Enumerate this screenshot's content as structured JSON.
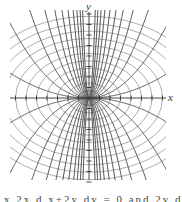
{
  "figure": {
    "type": "orthogonal-trajectories",
    "axes": {
      "x_label": "x",
      "y_label": "y"
    },
    "families": [
      {
        "name": "parabolas",
        "equation": "y = c x^2",
        "stroke": "#555555"
      },
      {
        "name": "ellipses",
        "equation": "x^2 + 2y^2 = k",
        "stroke": "#888888"
      }
    ],
    "caption_fragment": "x 2x  d  x+2y  dy = 0  and  2y dy"
  },
  "colors": {
    "axis": "#333333",
    "parabola": "#555555",
    "ellipse": "#999999",
    "background": "#ffffff"
  }
}
